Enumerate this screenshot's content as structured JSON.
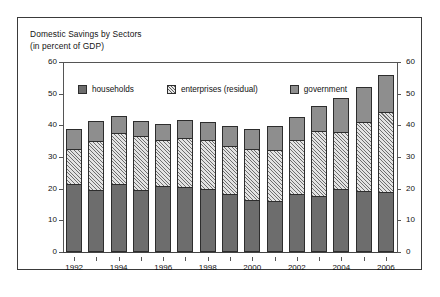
{
  "figure": {
    "title_line1": "Domestic Savings by Sectors",
    "title_line2": "(in percent of GDP)",
    "frame_color": "#3a3a3a",
    "background_color": "#ffffff"
  },
  "legend": {
    "position": "inside-top-left",
    "items": [
      {
        "label": "households",
        "swatch": "solid-dark-gray",
        "color": "#6d6d6d"
      },
      {
        "label": "enterprises (residual)",
        "swatch": "hatched-light-gray",
        "color": "#e3e3e3"
      },
      {
        "label": "government",
        "swatch": "solid-medium-gray",
        "color": "#8e8e8e"
      }
    ]
  },
  "axes": {
    "y_left_ticks": [
      "0",
      "10",
      "20",
      "30",
      "40",
      "50",
      "60"
    ],
    "y_right_ticks": [
      "0",
      "10",
      "20",
      "30",
      "40",
      "50",
      "60"
    ],
    "x_tick_labels": [
      "1992",
      "1994",
      "1996",
      "1998",
      "2000",
      "2002",
      "2004",
      "2006"
    ]
  },
  "chart_data": {
    "type": "bar",
    "stacked": true,
    "title": "Domestic Savings by Sectors",
    "subtitle": "(in percent of GDP)",
    "xlabel": "",
    "ylabel": "",
    "ylim": [
      0,
      60
    ],
    "ytick_step": 10,
    "grid": false,
    "legend_position": "upper left inside plot",
    "categories": [
      "1992",
      "1993",
      "1994",
      "1995",
      "1996",
      "1997",
      "1998",
      "1999",
      "2000",
      "2001",
      "2002",
      "2003",
      "2004",
      "2005",
      "2006"
    ],
    "series": [
      {
        "name": "households",
        "color": "#6d6d6d",
        "values": [
          21.5,
          19.5,
          21.5,
          19.5,
          21.0,
          20.5,
          20.0,
          18.3,
          16.5,
          16.0,
          18.3,
          17.7,
          19.8,
          19.3,
          19.0
        ]
      },
      {
        "name": "enterprises (residual)",
        "color": "#e3e3e3",
        "values": [
          11.0,
          15.5,
          16.0,
          17.0,
          14.3,
          15.5,
          15.3,
          15.2,
          16.0,
          16.2,
          17.0,
          20.5,
          18.2,
          21.7,
          25.2
        ]
      },
      {
        "name": "government",
        "color": "#8e8e8e",
        "values": [
          6.5,
          6.5,
          5.5,
          4.8,
          5.2,
          5.7,
          5.7,
          6.3,
          6.3,
          7.6,
          7.2,
          7.8,
          10.7,
          11.2,
          11.8
        ]
      }
    ],
    "totals": [
      39.0,
      41.5,
      43.0,
      41.3,
      40.5,
      41.7,
      41.0,
      39.8,
      38.8,
      39.8,
      42.5,
      46.0,
      48.7,
      52.2,
      56.0
    ]
  }
}
